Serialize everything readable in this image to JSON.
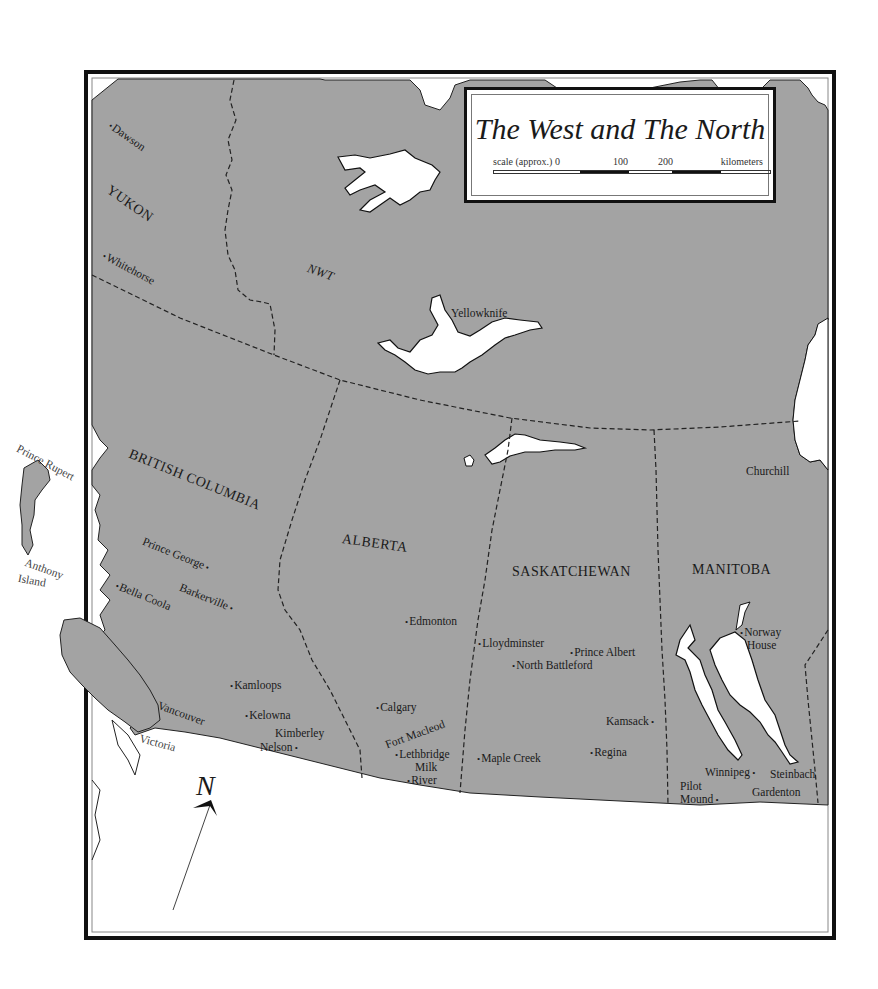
{
  "map": {
    "title": "The West and The North",
    "scale": {
      "prefix": "scale (approx.) 0",
      "ticks": [
        "100",
        "200"
      ],
      "unit": "kilometers",
      "segments": [
        "white",
        "black",
        "white",
        "black",
        "white"
      ]
    },
    "colors": {
      "land": "#a3a3a3",
      "water": "#ffffff",
      "frame": "#111111",
      "boundary": "#222222"
    },
    "north_arrow": {
      "label": "N"
    },
    "territories": [
      {
        "name": "YUKON"
      },
      {
        "name": "NWT"
      }
    ],
    "provinces": [
      {
        "name": "BRITISH COLUMBIA"
      },
      {
        "name": "ALBERTA"
      },
      {
        "name": "SASKATCHEWAN"
      },
      {
        "name": "MANITOBA"
      }
    ],
    "places": {
      "dawson": "Dawson",
      "whitehorse": "Whitehorse",
      "yellowknife": "Yellowknife",
      "churchill": "Churchill",
      "prince_rupert": "Prince Rupert",
      "anthony_island_1": "Anthony",
      "anthony_island_2": "Island",
      "prince_george": "Prince George",
      "barkerville": "Barkerville",
      "bella_coola": "Bella Coola",
      "kamloops": "Kamloops",
      "kelowna": "Kelowna",
      "kimberley": "Kimberley",
      "nelson": "Nelson",
      "vancouver": "Vancouver",
      "victoria": "Victoria",
      "edmonton": "Edmonton",
      "calgary": "Calgary",
      "fort_macleod": "Fort Macleod",
      "lethbridge": "Lethbridge",
      "milk_river_1": "Milk",
      "milk_river_2": "River",
      "lloydminster": "Lloydminster",
      "north_battleford": "North Battleford",
      "prince_albert": "Prince Albert",
      "maple_creek": "Maple Creek",
      "regina": "Regina",
      "kamsack": "Kamsack",
      "norway_house_1": "Norway",
      "norway_house_2": "House",
      "winnipeg": "Winnipeg",
      "steinbach": "Steinbach",
      "pilot_mound_1": "Pilot",
      "pilot_mound_2": "Mound",
      "gardenton": "Gardenton"
    }
  }
}
